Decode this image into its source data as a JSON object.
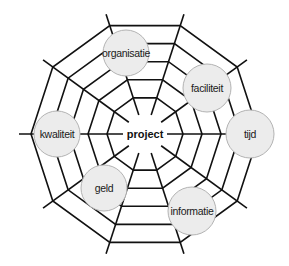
{
  "diagram": {
    "type": "spider-web",
    "center": {
      "label": "project",
      "x": 145,
      "y": 134
    },
    "spokes": {
      "count": 10,
      "inner_radius": 20,
      "outer_radius": 126,
      "start_angle_deg": 0
    },
    "rings": {
      "radii": [
        38,
        57,
        76,
        95,
        114
      ]
    },
    "nodes": [
      {
        "label": "organisatie",
        "x": 126,
        "y": 53,
        "r": 23
      },
      {
        "label": "faciliteit",
        "x": 207,
        "y": 88,
        "r": 24
      },
      {
        "label": "tijd",
        "x": 250,
        "y": 134,
        "r": 24
      },
      {
        "label": "informatie",
        "x": 192,
        "y": 211,
        "r": 24
      },
      {
        "label": "geld",
        "x": 104,
        "y": 188,
        "r": 23
      },
      {
        "label": "kwaliteit",
        "x": 57,
        "y": 134,
        "r": 23
      }
    ],
    "colors": {
      "line": "#111111",
      "node_fill": "#ececec",
      "node_stroke": "#b3b3b3",
      "background": "#ffffff"
    }
  }
}
